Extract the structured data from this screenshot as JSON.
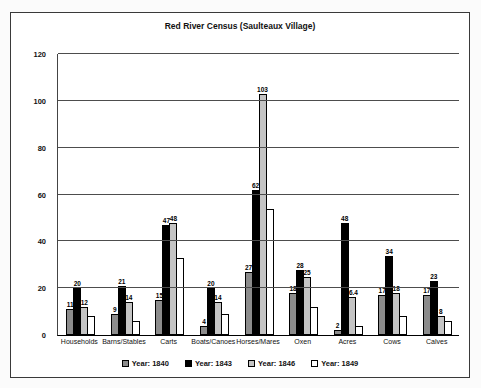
{
  "title": "Red River Census (Saulteaux Village)",
  "chart_data": {
    "type": "bar",
    "title": "Red River Census (Saulteaux Village)",
    "categories": [
      "Households",
      "Barns/Stables",
      "Carts",
      "Boats/Canoes",
      "Horses/Mares",
      "Oxen",
      "Acres",
      "Cows",
      "Calves"
    ],
    "series": [
      {
        "name": "Year: 1840",
        "color": "#8c8c8c",
        "values": [
          11,
          9,
          15,
          4,
          27,
          18,
          2,
          17,
          17
        ],
        "labels": [
          "11",
          "9",
          "15",
          "4",
          "27",
          "18",
          "2",
          "17",
          "17"
        ]
      },
      {
        "name": "Year: 1843",
        "color": "#000000",
        "values": [
          20,
          21,
          47,
          20,
          62,
          28,
          48,
          34,
          23
        ],
        "labels": [
          "20",
          "21",
          "47",
          "20",
          "62",
          "28",
          "48",
          "34",
          "23"
        ]
      },
      {
        "name": "Year: 1846",
        "color": "#c4c4c4",
        "values": [
          12,
          14,
          48,
          14,
          103,
          25,
          16.4,
          18,
          8
        ],
        "labels": [
          "12",
          "14",
          "48",
          "14",
          "103",
          "25",
          "16.4",
          "18",
          "8"
        ]
      },
      {
        "name": "Year: 1849",
        "color": "#ffffff",
        "values": [
          8,
          6,
          33,
          9,
          54,
          12,
          4,
          8,
          6
        ],
        "labels": [
          "",
          "",
          "",
          "",
          "",
          "",
          "",
          "",
          ""
        ]
      }
    ],
    "ylim": [
      0,
      120
    ],
    "yticks": [
      0,
      20,
      40,
      60,
      80,
      100,
      120
    ],
    "grid": true,
    "legend_position": "bottom"
  }
}
